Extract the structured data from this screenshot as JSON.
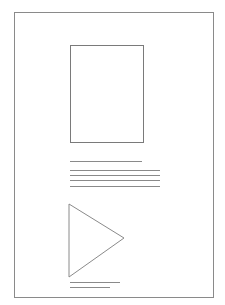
{
  "page": {
    "width": 225,
    "height": 305,
    "background": "#ffffff",
    "stroke": "#8a8a8a"
  },
  "frame": {
    "x": 14,
    "y": 12,
    "w": 199,
    "h": 285
  },
  "image_placeholder": {
    "x": 70,
    "y": 45,
    "w": 73,
    "h": 97
  },
  "text_lines": [
    {
      "x1": 70,
      "y1": 161,
      "x2": 142,
      "y2": 161
    },
    {
      "x1": 70,
      "y1": 170,
      "x2": 160,
      "y2": 170
    },
    {
      "x1": 70,
      "y1": 175,
      "x2": 160,
      "y2": 175
    },
    {
      "x1": 70,
      "y1": 180,
      "x2": 160,
      "y2": 180
    },
    {
      "x1": 70,
      "y1": 186,
      "x2": 160,
      "y2": 186
    }
  ],
  "play_triangle": {
    "points": "69,204 69,277 124,238"
  },
  "caption_lines": [
    {
      "x1": 70,
      "y1": 282,
      "x2": 120,
      "y2": 282
    },
    {
      "x1": 70,
      "y1": 287,
      "x2": 110,
      "y2": 287
    }
  ]
}
